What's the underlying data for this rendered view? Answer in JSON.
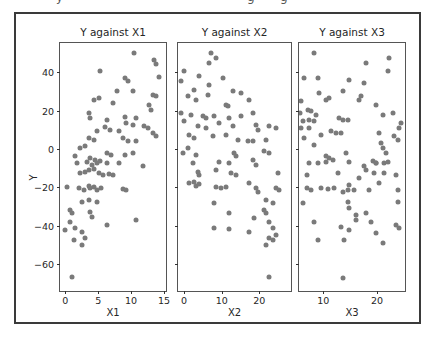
{
  "page": {
    "background": "#ffffff"
  },
  "top_fragments": {
    "fragments": [
      "y",
      "g",
      "g"
    ]
  },
  "figure": {
    "ylabel": "Y",
    "frame_color": "#3a3a3a",
    "axis_color": "#555555",
    "dot_color": "#7a7a7a",
    "text_color": "#262626"
  },
  "chart_data": [
    {
      "type": "scatter",
      "title": "Y against X1",
      "xlabel": "X1",
      "ylabel": "Y",
      "xlim": [
        -0.8,
        15.3
      ],
      "ylim": [
        -73.8,
        55.1
      ],
      "xticks": [
        0,
        5,
        10,
        15
      ],
      "yticks": [
        40,
        20,
        0,
        -20,
        -40,
        -60
      ],
      "show_ytick_labels": true,
      "grid": false,
      "points": [
        [
          10.5,
          49.7
        ],
        [
          13.5,
          46.1
        ],
        [
          13.8,
          44
        ],
        [
          5.3,
          40.4
        ],
        [
          14.3,
          37.3
        ],
        [
          9,
          36.8
        ],
        [
          9.6,
          35.2
        ],
        [
          7.8,
          30.1
        ],
        [
          10.3,
          30
        ],
        [
          13.3,
          28
        ],
        [
          13.8,
          27.5
        ],
        [
          4.3,
          25.4
        ],
        [
          5.1,
          26.4
        ],
        [
          7.3,
          23.8
        ],
        [
          12.7,
          22.8
        ],
        [
          13,
          20.2
        ],
        [
          3.6,
          18.7
        ],
        [
          3.7,
          16.1
        ],
        [
          6.3,
          15
        ],
        [
          9,
          16.6
        ],
        [
          10.8,
          16.1
        ],
        [
          9.3,
          13.5
        ],
        [
          10.3,
          12.4
        ],
        [
          6,
          11.4
        ],
        [
          6.8,
          9.8
        ],
        [
          4.8,
          9.3
        ],
        [
          8.1,
          9.3
        ],
        [
          12,
          11.9
        ],
        [
          12.6,
          10.9
        ],
        [
          13.3,
          8.3
        ],
        [
          13.8,
          6.7
        ],
        [
          3.6,
          5.7
        ],
        [
          4.3,
          4.7
        ],
        [
          8.8,
          5.7
        ],
        [
          9.6,
          4.1
        ],
        [
          10.8,
          4.1
        ],
        [
          2.2,
          0.5
        ],
        [
          3,
          1.6
        ],
        [
          6.3,
          -2.1
        ],
        [
          7,
          -3.1
        ],
        [
          9,
          -3.1
        ],
        [
          10.3,
          -2.1
        ],
        [
          1.5,
          -3.6
        ],
        [
          3.7,
          -4.7
        ],
        [
          4.5,
          -5.7
        ],
        [
          5.3,
          -6.2
        ],
        [
          1.8,
          -7.3
        ],
        [
          3.3,
          -6.7
        ],
        [
          4,
          -8.3
        ],
        [
          4.8,
          -7.3
        ],
        [
          6.3,
          -7.3
        ],
        [
          8.1,
          -7.3
        ],
        [
          11.8,
          -8.8
        ],
        [
          2.2,
          -12.4
        ],
        [
          3,
          -11.9
        ],
        [
          3.6,
          -10.9
        ],
        [
          4.3,
          -10.4
        ],
        [
          5.1,
          -12.4
        ],
        [
          5.8,
          -13.5
        ],
        [
          6.6,
          -13
        ],
        [
          7.3,
          -13.5
        ],
        [
          0.3,
          -19.7
        ],
        [
          2.1,
          -20.2
        ],
        [
          2.8,
          -21.2
        ],
        [
          3.6,
          -19.2
        ],
        [
          3.7,
          -20.2
        ],
        [
          4.3,
          -19.7
        ],
        [
          4.8,
          -21.2
        ],
        [
          5.5,
          -20.2
        ],
        [
          8.8,
          -20.7
        ],
        [
          9.3,
          -21.2
        ],
        [
          2.5,
          -27.5
        ],
        [
          3.6,
          -26.4
        ],
        [
          4.8,
          -27.5
        ],
        [
          0.7,
          -31.6
        ],
        [
          1,
          -33.2
        ],
        [
          3.7,
          -32.6
        ],
        [
          4,
          -35.2
        ],
        [
          0.7,
          -37.8
        ],
        [
          10.8,
          -36.8
        ],
        [
          1.5,
          -40.9
        ],
        [
          6.3,
          -39.4
        ],
        [
          -0.1,
          -42
        ],
        [
          2.5,
          -43
        ],
        [
          1.3,
          -47.2
        ],
        [
          3,
          -46.1
        ],
        [
          2.5,
          -49.7
        ],
        [
          1,
          -66.3
        ]
      ]
    },
    {
      "type": "scatter",
      "title": "Y against X2",
      "xlabel": "X2",
      "ylabel": "Y",
      "xlim": [
        -1.6,
        28.4
      ],
      "ylim": [
        -73.8,
        55.1
      ],
      "xticks": [
        0,
        10,
        20
      ],
      "yticks": [
        40,
        20,
        0,
        -20,
        -40,
        -60
      ],
      "show_ytick_labels": false,
      "grid": false,
      "points": [
        [
          7.2,
          49.7
        ],
        [
          8.5,
          47.2
        ],
        [
          6.6,
          44.6
        ],
        [
          0,
          40.4
        ],
        [
          4,
          37.8
        ],
        [
          -0.8,
          35.2
        ],
        [
          10.3,
          36.8
        ],
        [
          6.6,
          33.2
        ],
        [
          2.7,
          30.6
        ],
        [
          13,
          30.1
        ],
        [
          15.1,
          29
        ],
        [
          1.1,
          27.5
        ],
        [
          3.2,
          25.4
        ],
        [
          6.4,
          28
        ],
        [
          17.2,
          25.4
        ],
        [
          11.1,
          22.8
        ],
        [
          11.7,
          22.3
        ],
        [
          -0.8,
          18.7
        ],
        [
          1.9,
          17.6
        ],
        [
          5,
          17.1
        ],
        [
          5.8,
          16.1
        ],
        [
          8,
          17.1
        ],
        [
          11.9,
          16.1
        ],
        [
          15.1,
          17.1
        ],
        [
          18.3,
          18.7
        ],
        [
          0,
          14.5
        ],
        [
          3.7,
          11.9
        ],
        [
          5.8,
          10.9
        ],
        [
          9.3,
          13.5
        ],
        [
          13,
          11.9
        ],
        [
          19.1,
          12.4
        ],
        [
          19.6,
          9.8
        ],
        [
          22.5,
          11.9
        ],
        [
          24.4,
          10.9
        ],
        [
          1.3,
          7.3
        ],
        [
          2.7,
          5.7
        ],
        [
          7.7,
          6.7
        ],
        [
          11.1,
          7.3
        ],
        [
          14.3,
          4.7
        ],
        [
          17,
          4.1
        ],
        [
          18.3,
          4.1
        ],
        [
          21.8,
          4.7
        ],
        [
          1.1,
          0.5
        ],
        [
          -0.3,
          -2.1
        ],
        [
          3.2,
          -3.1
        ],
        [
          13.3,
          -2.1
        ],
        [
          13.8,
          -3.6
        ],
        [
          18.3,
          -5.7
        ],
        [
          21.2,
          -1
        ],
        [
          22.5,
          -2.1
        ],
        [
          2.4,
          -7.3
        ],
        [
          9.3,
          -6.7
        ],
        [
          11.9,
          -7.3
        ],
        [
          19.1,
          -8.3
        ],
        [
          3.7,
          -11.9
        ],
        [
          4,
          -13.5
        ],
        [
          8.5,
          -10.9
        ],
        [
          12.5,
          -12.4
        ],
        [
          13.8,
          -13.5
        ],
        [
          24.9,
          -12.4
        ],
        [
          1.3,
          -17.6
        ],
        [
          2.7,
          -17.1
        ],
        [
          3.2,
          -19.2
        ],
        [
          4,
          -18.1
        ],
        [
          8.5,
          -19.7
        ],
        [
          9.8,
          -20.2
        ],
        [
          11.1,
          -19.7
        ],
        [
          17.2,
          -17.6
        ],
        [
          19.1,
          -20.2
        ],
        [
          19.6,
          -22.3
        ],
        [
          24.4,
          -20.2
        ],
        [
          25.2,
          -21.2
        ],
        [
          8,
          -28
        ],
        [
          21.8,
          -26.4
        ],
        [
          23.6,
          -28
        ],
        [
          21.2,
          -31.6
        ],
        [
          21.8,
          -33.2
        ],
        [
          11.9,
          -33.2
        ],
        [
          18.6,
          -35.8
        ],
        [
          22.5,
          -37.8
        ],
        [
          8,
          -40.9
        ],
        [
          11.9,
          -41.5
        ],
        [
          17.2,
          -43
        ],
        [
          23.6,
          -40.9
        ],
        [
          24.4,
          -44.6
        ],
        [
          22.5,
          -46.1
        ],
        [
          23.6,
          -47.2
        ],
        [
          21.8,
          -49.7
        ],
        [
          22.5,
          -66.3
        ]
      ]
    },
    {
      "type": "scatter",
      "title": "Y against X3",
      "xlabel": "X3",
      "ylabel": "Y",
      "xlim": [
        5.5,
        25.2
      ],
      "ylim": [
        -73.8,
        55.1
      ],
      "xticks": [
        10,
        20
      ],
      "yticks": [
        40,
        20,
        0,
        -20,
        -40,
        -60
      ],
      "show_ytick_labels": false,
      "grid": false,
      "points": [
        [
          8.3,
          49.7
        ],
        [
          22.2,
          47.2
        ],
        [
          18,
          44.6
        ],
        [
          22,
          40.4
        ],
        [
          6.5,
          36.8
        ],
        [
          9.1,
          36.8
        ],
        [
          14.8,
          35.8
        ],
        [
          17.6,
          34.2
        ],
        [
          13.7,
          30.1
        ],
        [
          9.3,
          29
        ],
        [
          11.1,
          26.4
        ],
        [
          10.6,
          25.4
        ],
        [
          17,
          27.5
        ],
        [
          16.7,
          25.4
        ],
        [
          5.9,
          24.9
        ],
        [
          19.8,
          22.8
        ],
        [
          5.6,
          18.7
        ],
        [
          7.2,
          20.2
        ],
        [
          7.8,
          19.7
        ],
        [
          8.7,
          17.6
        ],
        [
          13,
          16.1
        ],
        [
          13.7,
          15
        ],
        [
          14.6,
          15
        ],
        [
          21.1,
          17.6
        ],
        [
          23,
          18.7
        ],
        [
          6.3,
          14.5
        ],
        [
          7.4,
          15
        ],
        [
          8.3,
          14.5
        ],
        [
          5.9,
          10.9
        ],
        [
          7.4,
          10.9
        ],
        [
          11.5,
          9.3
        ],
        [
          12.4,
          8.3
        ],
        [
          13.3,
          8.3
        ],
        [
          24.1,
          10.9
        ],
        [
          24.4,
          13.5
        ],
        [
          9.6,
          7.3
        ],
        [
          6.5,
          5.7
        ],
        [
          8.3,
          2.1
        ],
        [
          20.4,
          8.3
        ],
        [
          23.1,
          6.7
        ],
        [
          23.9,
          4.7
        ],
        [
          20.7,
          3.1
        ],
        [
          21.1,
          0.5
        ],
        [
          21.7,
          -2.1
        ],
        [
          14.3,
          -2.1
        ],
        [
          10.6,
          -3.6
        ],
        [
          11.1,
          -4.7
        ],
        [
          11.9,
          -5.7
        ],
        [
          19.3,
          -6.2
        ],
        [
          19.8,
          -7.3
        ],
        [
          7.4,
          -7.3
        ],
        [
          9.1,
          -7.3
        ],
        [
          10.6,
          -6.7
        ],
        [
          14.8,
          -6.7
        ],
        [
          17.6,
          -8.8
        ],
        [
          19.8,
          -7.3
        ],
        [
          21.3,
          -7.3
        ],
        [
          22,
          -6.7
        ],
        [
          6.9,
          -13.5
        ],
        [
          12.8,
          -12.4
        ],
        [
          16.7,
          -15
        ],
        [
          18,
          -10.9
        ],
        [
          19.4,
          -12.4
        ],
        [
          21.3,
          -12.4
        ],
        [
          23.5,
          -13.5
        ],
        [
          6.9,
          -20.2
        ],
        [
          7.8,
          -21.2
        ],
        [
          9.6,
          -20.2
        ],
        [
          10.9,
          -20.7
        ],
        [
          12,
          -20.2
        ],
        [
          13.7,
          -22.3
        ],
        [
          14.6,
          -21.2
        ],
        [
          14.8,
          -18.7
        ],
        [
          15.7,
          -21.2
        ],
        [
          18.5,
          -21.2
        ],
        [
          20.4,
          -17.6
        ],
        [
          23.9,
          -21.2
        ],
        [
          6.3,
          -28
        ],
        [
          14.6,
          -27.5
        ],
        [
          14.8,
          -30.6
        ],
        [
          23.9,
          -27.5
        ],
        [
          16.1,
          -34.2
        ],
        [
          18,
          -33.2
        ],
        [
          16.1,
          -36.8
        ],
        [
          8.3,
          -37.8
        ],
        [
          13.3,
          -40.4
        ],
        [
          14.8,
          -42
        ],
        [
          18.9,
          -37.8
        ],
        [
          23.5,
          -39.4
        ],
        [
          24.1,
          -40.9
        ],
        [
          19.8,
          -43.5
        ],
        [
          13.9,
          -47.2
        ],
        [
          9.1,
          -47.2
        ],
        [
          21.1,
          -48.7
        ],
        [
          13.7,
          -66.8
        ]
      ]
    }
  ]
}
